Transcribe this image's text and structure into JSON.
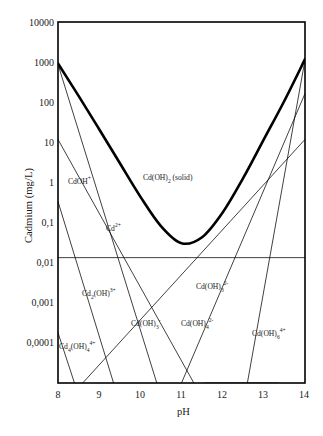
{
  "chart_data": {
    "type": "line",
    "title": "",
    "xlabel": "pH",
    "ylabel": "Cadmium (mg/L)",
    "xlim": [
      8,
      14
    ],
    "ylim": [
      0.0001,
      10000
    ],
    "yscale": "log",
    "grid": false,
    "legend_position": "none",
    "xticks": [
      "8",
      "9",
      "10",
      "11",
      "12",
      "13",
      "14"
    ],
    "xtick_values": [
      8,
      9,
      10,
      11,
      12,
      13,
      14
    ],
    "yticks": [
      "10000",
      "1000",
      "100",
      "10",
      "1",
      "0,1",
      "0,01",
      "0,001",
      "0,0001"
    ],
    "ytick_values": [
      10000,
      1000,
      100,
      10,
      1,
      0.1,
      0.01,
      0.001,
      0.0001
    ],
    "series": [
      {
        "name": "Cd(OH)2 (solid) total solubility",
        "style": "thick",
        "x": [
          8.0,
          8.5,
          9.0,
          9.5,
          10.0,
          10.5,
          11.0,
          11.5,
          12.0,
          12.5,
          13.0,
          13.5,
          14.0
        ],
        "y": [
          1200,
          230,
          42,
          7.5,
          1.35,
          0.3,
          0.125,
          0.17,
          0.6,
          3.5,
          25,
          180,
          1500
        ]
      },
      {
        "name": "Cd2+",
        "style": "thin",
        "x": [
          8.0,
          10.4
        ],
        "y": [
          1150,
          0.0001
        ]
      },
      {
        "name": "CdOH+",
        "style": "thin",
        "x": [
          8.0,
          11.3
        ],
        "y": [
          25,
          0.0001
        ]
      },
      {
        "name": "Cd2(OH)3+",
        "style": "thin",
        "x": [
          8.0,
          9.35
        ],
        "y": [
          1.05,
          0.0001
        ]
      },
      {
        "name": "Cd4(OH)4 4+",
        "style": "thin",
        "x": [
          8.0,
          8.4
        ],
        "y": [
          0.0013,
          0.0001
        ]
      },
      {
        "name": "Cd(OH)3-",
        "style": "thin",
        "x": [
          8.6,
          14.0
        ],
        "y": [
          0.0001,
          25
        ]
      },
      {
        "name": "Cd(OH)4 2-",
        "style": "thin",
        "x": [
          11.0,
          14.0
        ],
        "y": [
          0.0001,
          260
        ]
      },
      {
        "name": "Cd(OH)6 4+",
        "style": "thin",
        "x": [
          11.55,
          13.35
        ],
        "y": [
          0.0001,
          0.0001
        ]
      },
      {
        "name": "Cd(OH)3 2-",
        "style": "thin",
        "x": [
          12.6,
          14.0
        ],
        "y": [
          0.0001,
          1450
        ]
      },
      {
        "name": "regulatory limit horizontal line",
        "style": "thin-horizontal",
        "x": [
          8.0,
          14.0
        ],
        "y": [
          0.06,
          0.06
        ]
      }
    ],
    "annotations": [
      {
        "key": "cdoh_plus",
        "text_html": "CdOH<sup>+</sup>",
        "text": "CdOH+",
        "x_px": 68,
        "y_px": 178
      },
      {
        "key": "cd_oh_2_solid",
        "text_html": "Cd(OH)<sub>2</sub> (solid)",
        "text": "Cd(OH)2 (solid)",
        "x_px": 143,
        "y_px": 174
      },
      {
        "key": "cd_2plus",
        "text_html": "Cd<sup>2+</sup>",
        "text": "Cd2+",
        "x_px": 106,
        "y_px": 225
      },
      {
        "key": "cd2_oh_3plus",
        "text_html": "Cd<sub>2</sub>(OH)<sup>3+</sup>",
        "text": "Cd2(OH)3+",
        "x_px": 82,
        "y_px": 290
      },
      {
        "key": "cd_oh_3_2minus",
        "text_html": "Cd(OH)<sub>3</sub><sup>2-</sup>",
        "text": "Cd(OH)3 2-",
        "x_px": 196,
        "y_px": 283
      },
      {
        "key": "cd_oh_3_minus",
        "text_html": "Cd(OH)<sub>3</sub><sup>-</sup>",
        "text": "Cd(OH)3-",
        "x_px": 131,
        "y_px": 320
      },
      {
        "key": "cd_oh_4_2minus",
        "text_html": "Cd(OH)<sub>4</sub><sup>2-</sup>",
        "text": "Cd(OH)4 2-",
        "x_px": 181,
        "y_px": 320
      },
      {
        "key": "cd_oh_6_4plus",
        "text_html": "Cd(OH)<sub>6</sub><sup>4+</sup>",
        "text": "Cd(OH)6 4+",
        "x_px": 252,
        "y_px": 330
      },
      {
        "key": "cd4_oh_4_4plus",
        "text_html": "Cd<sub>4</sub>(OH)<sub>4</sub><sup>4+</sup>",
        "text": "Cd4(OH)4 4+",
        "x_px": 59,
        "y_px": 343
      }
    ]
  },
  "axes": {
    "xlabel": "pH",
    "ylabel": "Cadmium (mg/L)",
    "xticks": [
      "8",
      "9",
      "10",
      "11",
      "12",
      "13",
      "14"
    ],
    "yticks": [
      "10000",
      "1000",
      "100",
      "10",
      "1",
      "0,1",
      "0,01",
      "0,001",
      "0,0001"
    ]
  },
  "colors": {
    "line": "#000000",
    "frame": "#000000",
    "background": "#ffffff",
    "text": "#1a1a1a"
  }
}
